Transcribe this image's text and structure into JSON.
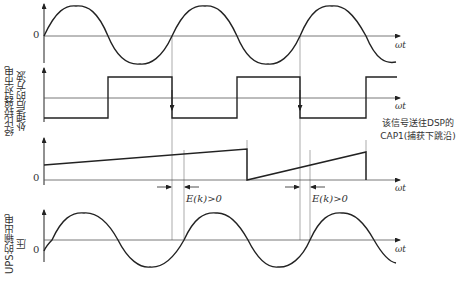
{
  "figure": {
    "panels": [
      {
        "id": "mains-voltage",
        "y_label": "",
        "zero_label": "0",
        "x_axis_label": "ωt"
      },
      {
        "id": "comparator-square-wave",
        "y_label": "经比较器对市电处理后的方波",
        "zero_label": "",
        "x_axis_label": "ωt"
      },
      {
        "id": "sawtooth-counter",
        "y_label": "",
        "zero_label": "0",
        "x_axis_label": "ωt"
      },
      {
        "id": "ups-output-voltage",
        "y_label": "UPS的输出电压",
        "zero_label": "0",
        "x_axis_label": "ωt"
      }
    ],
    "annotation": {
      "line1": "该信号送往DSP的",
      "line2": "CAP1(捕获下跳沿)"
    },
    "phase_error_labels": [
      "E(k)>0",
      "E(k)>0"
    ],
    "colors": {
      "stroke": "#222222",
      "axis": "#555555",
      "guide": "#888888"
    }
  }
}
